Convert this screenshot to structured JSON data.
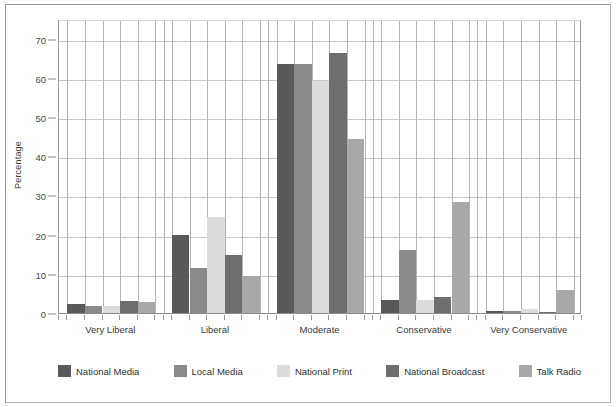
{
  "chart_data": {
    "type": "bar",
    "title": "",
    "xlabel": "",
    "ylabel": "Percentage",
    "ylim": [
      0,
      75
    ],
    "yticks": [
      0,
      10,
      20,
      30,
      40,
      50,
      60,
      70
    ],
    "grid": true,
    "legend_position": "bottom",
    "categories": [
      "Very Liberal",
      "Liberal",
      "Moderate",
      "Conservative",
      "Very Conservative"
    ],
    "series": [
      {
        "name": "National Media",
        "color": "#595959",
        "values": [
          2.2,
          20.0,
          63.5,
          3.2,
          0.5
        ]
      },
      {
        "name": "Local Media",
        "color": "#8a8a8a",
        "values": [
          1.8,
          11.6,
          63.5,
          16.2,
          0.5
        ]
      },
      {
        "name": "National Print",
        "color": "#dcdcdc",
        "values": [
          1.8,
          24.6,
          59.2,
          3.2,
          1.0
        ]
      },
      {
        "name": "National Broadcast",
        "color": "#6e6e6e",
        "values": [
          3.0,
          14.9,
          66.3,
          4.2,
          0.2
        ]
      },
      {
        "name": "Talk Radio",
        "color": "#a8a8a8",
        "values": [
          2.7,
          9.4,
          44.3,
          28.2,
          5.9
        ]
      }
    ]
  },
  "axes": {
    "y_title": "Percentage"
  }
}
